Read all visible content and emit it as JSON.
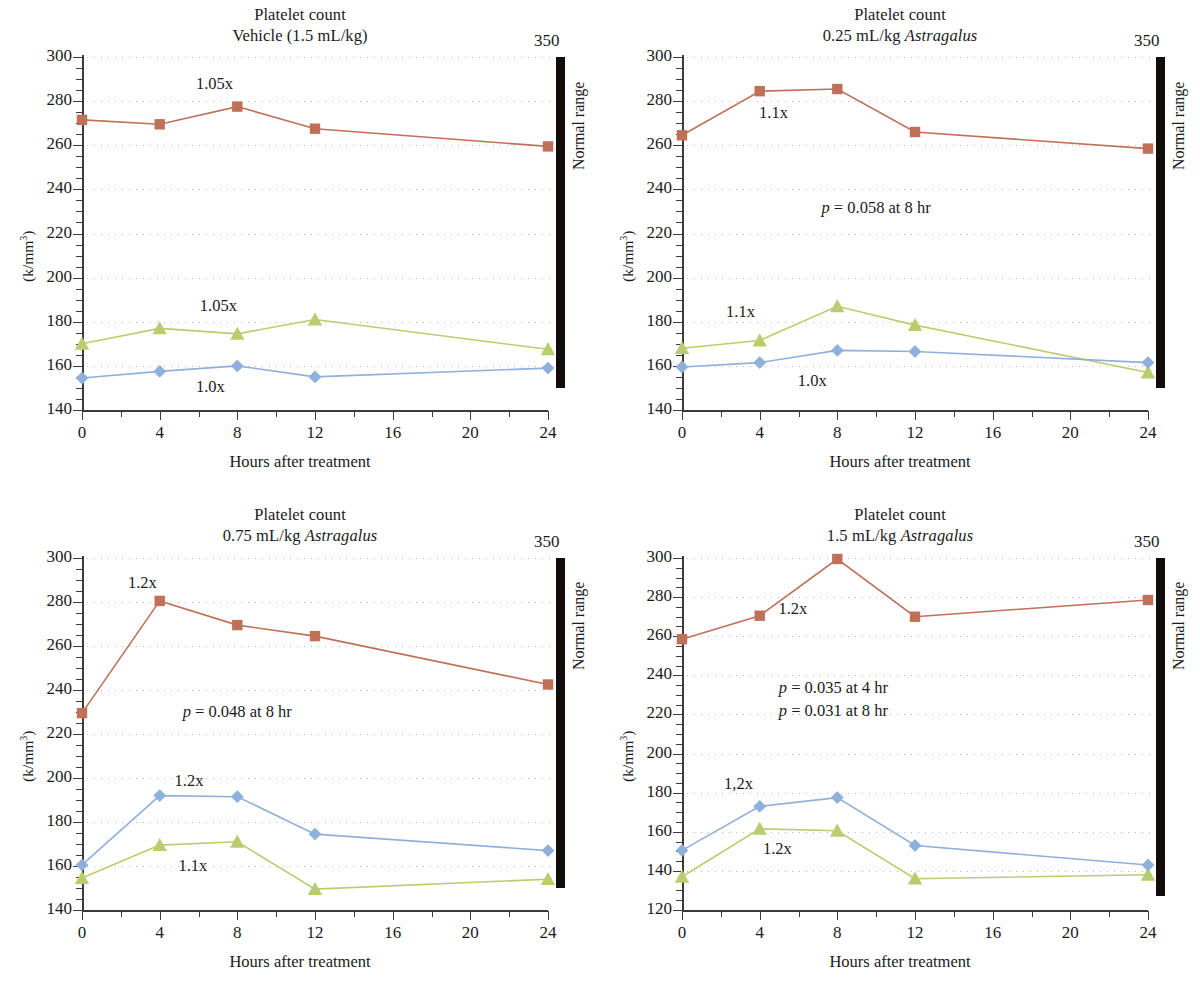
{
  "figure": {
    "colors": {
      "red": "#c07059",
      "green": "#b9cd6e",
      "blue": "#8fb0db",
      "normal_range_bar": "#120d0a",
      "axis": "#3b3b3b",
      "gridline": "#b9b9b9"
    },
    "shared": {
      "title_line1": "Platelet count",
      "ylabel_prefix": "(k/mm",
      "ylabel_sup": "3",
      "ylabel_suffix": ")",
      "xlabel": "Hours after treatment",
      "normal_range_label": "Normal range",
      "normal_range_top_value": "350",
      "x_major_ticks": [
        "0",
        "4",
        "8",
        "12",
        "16",
        "20",
        "24"
      ],
      "x_minor_ticks": [
        "2",
        "6",
        "10",
        "14",
        "18",
        "22"
      ]
    }
  },
  "chart_data": [
    {
      "id": "panel-vehicle",
      "type": "line",
      "title": "Platelet count",
      "subtitle": "Vehicle (1.5 mL/kg)",
      "subtitle_italic_part": "",
      "xlabel": "Hours after treatment",
      "ylabel": "(k/mm3)",
      "x": [
        0,
        4,
        8,
        12,
        24
      ],
      "xlim": [
        0,
        24
      ],
      "ylim": [
        140,
        300
      ],
      "y_major_ticks": [
        140,
        160,
        180,
        200,
        220,
        240,
        260,
        280,
        300
      ],
      "y_minor_step": 5,
      "grid": "dotted-horizontal",
      "legend": "none",
      "series": [
        {
          "name": "red-squares",
          "marker": "square",
          "color": "#c07059",
          "values": [
            271.5,
            269.5,
            277.5,
            267.5,
            259.5
          ]
        },
        {
          "name": "green-triangles",
          "marker": "triangle",
          "color": "#b9cd6e",
          "values": [
            170.0,
            177.0,
            174.5,
            181.0,
            167.5
          ]
        },
        {
          "name": "blue-diamonds",
          "marker": "diamond",
          "color": "#8fb0db",
          "values": [
            154.5,
            157.5,
            160.0,
            155.0,
            159.0
          ]
        }
      ],
      "annotations": [
        {
          "text": "1.05x",
          "x": 7.0,
          "y": 287.5
        },
        {
          "text": "1.05x",
          "x": 7.2,
          "y": 186.5
        },
        {
          "text": "1.0x",
          "x": 7.0,
          "y": 150.0
        }
      ],
      "pvalues": [],
      "normal_range": {
        "top": 350,
        "bar_from": 300,
        "bar_to": 150,
        "label": "Normal range",
        "top_value": "350"
      }
    },
    {
      "id": "panel-025",
      "type": "line",
      "title": "Platelet count",
      "subtitle": "0.25 mL/kg Astragalus",
      "subtitle_plain": "0.25 mL/kg ",
      "subtitle_italic_part": "Astragalus",
      "xlabel": "Hours after treatment",
      "ylabel": "(k/mm3)",
      "x": [
        0,
        4,
        8,
        12,
        24
      ],
      "xlim": [
        0,
        24
      ],
      "ylim": [
        140,
        300
      ],
      "y_major_ticks": [
        140,
        160,
        180,
        200,
        220,
        240,
        260,
        280,
        300
      ],
      "y_minor_step": 5,
      "grid": "dotted-horizontal",
      "legend": "none",
      "series": [
        {
          "name": "red-squares",
          "marker": "square",
          "color": "#c07059",
          "values": [
            264.5,
            284.5,
            285.5,
            266.0,
            258.5
          ]
        },
        {
          "name": "green-triangles",
          "marker": "triangle",
          "color": "#b9cd6e",
          "values": [
            168.0,
            171.5,
            187.0,
            178.5,
            157.0
          ]
        },
        {
          "name": "blue-diamonds",
          "marker": "diamond",
          "color": "#8fb0db",
          "values": [
            159.5,
            161.5,
            167.0,
            166.5,
            161.5
          ]
        }
      ],
      "annotations": [
        {
          "text": "1.1x",
          "x": 5.1,
          "y": 274.0
        },
        {
          "text": "1.1x",
          "x": 3.4,
          "y": 184.0
        },
        {
          "text": "1.0x",
          "x": 7.1,
          "y": 152.5
        }
      ],
      "pvalues": [
        {
          "text_p": "p",
          "text_rest": " = 0.058 at 8 hr",
          "x": 11.2,
          "y": 231.0
        }
      ],
      "normal_range": {
        "top": 350,
        "bar_from": 300,
        "bar_to": 150,
        "label": "Normal range",
        "top_value": "350"
      }
    },
    {
      "id": "panel-075",
      "type": "line",
      "title": "Platelet count",
      "subtitle": "0.75 mL/kg Astragalus",
      "subtitle_plain": "0.75 mL/kg ",
      "subtitle_italic_part": "Astragalus",
      "xlabel": "Hours after treatment",
      "ylabel": "(k/mm3)",
      "x": [
        0,
        4,
        8,
        12,
        24
      ],
      "xlim": [
        0,
        24
      ],
      "ylim": [
        140,
        300
      ],
      "y_major_ticks": [
        140,
        160,
        180,
        200,
        220,
        240,
        260,
        280,
        300
      ],
      "y_minor_step": 5,
      "grid": "dotted-horizontal",
      "legend": "none",
      "series": [
        {
          "name": "red-squares",
          "marker": "square",
          "color": "#c07059",
          "values": [
            229.5,
            280.5,
            269.5,
            264.5,
            242.5
          ]
        },
        {
          "name": "green-triangles",
          "marker": "triangle",
          "color": "#b9cd6e",
          "values": [
            154.5,
            169.5,
            171.0,
            149.5,
            154.0
          ]
        },
        {
          "name": "blue-diamonds",
          "marker": "diamond",
          "color": "#8fb0db",
          "values": [
            160.5,
            192.0,
            191.5,
            174.5,
            167.0
          ]
        }
      ],
      "annotations": [
        {
          "text": "1.2x",
          "x": 3.5,
          "y": 288.0
        },
        {
          "text": "1.2x",
          "x": 5.9,
          "y": 198.0
        },
        {
          "text": "1.1x",
          "x": 6.1,
          "y": 159.5
        }
      ],
      "pvalues": [
        {
          "text_p": "p",
          "text_rest": " = 0.048 at 8 hr",
          "x": 9.2,
          "y": 229.5
        }
      ],
      "normal_range": {
        "top": 350,
        "bar_from": 300,
        "bar_to": 150,
        "label": "Normal range",
        "top_value": "350"
      }
    },
    {
      "id": "panel-15",
      "type": "line",
      "title": "Platelet count",
      "subtitle": "1.5 mL/kg Astragalus",
      "subtitle_plain": "1.5 mL/kg ",
      "subtitle_italic_part": "Astragalus",
      "xlabel": "Hours after treatment",
      "ylabel": "(k/mm3)",
      "x": [
        0,
        4,
        8,
        12,
        24
      ],
      "xlim": [
        0,
        24
      ],
      "ylim": [
        120,
        300
      ],
      "y_major_ticks": [
        120,
        140,
        160,
        180,
        200,
        220,
        240,
        260,
        280,
        300
      ],
      "y_minor_step": 5,
      "grid": "dotted-horizontal",
      "legend": "none",
      "series": [
        {
          "name": "red-squares",
          "marker": "square",
          "color": "#c07059",
          "values": [
            258.5,
            270.5,
            299.5,
            270.0,
            278.5
          ]
        },
        {
          "name": "green-triangles",
          "marker": "triangle",
          "color": "#b9cd6e",
          "values": [
            137.0,
            161.5,
            160.5,
            136.0,
            138.0
          ]
        },
        {
          "name": "blue-diamonds",
          "marker": "diamond",
          "color": "#8fb0db",
          "values": [
            150.5,
            173.0,
            177.5,
            153.0,
            143.0
          ]
        }
      ],
      "annotations": [
        {
          "text": "1.2x",
          "x": 6.1,
          "y": 273.5
        },
        {
          "text": "1,2x",
          "x": 3.3,
          "y": 184.0
        },
        {
          "text": "1.2x",
          "x": 5.3,
          "y": 150.5
        }
      ],
      "pvalues": [
        {
          "text_p": "p",
          "text_rest": " = 0.035 at 4 hr",
          "x": 9.0,
          "y": 233.0
        },
        {
          "text_p": "p",
          "text_rest": " = 0.031 at 8 hr",
          "x": 9.0,
          "y": 221.0
        }
      ],
      "normal_range": {
        "top": 350,
        "bar_from": 300,
        "bar_to": 130,
        "label": "Normal range",
        "top_value": "350"
      }
    }
  ]
}
